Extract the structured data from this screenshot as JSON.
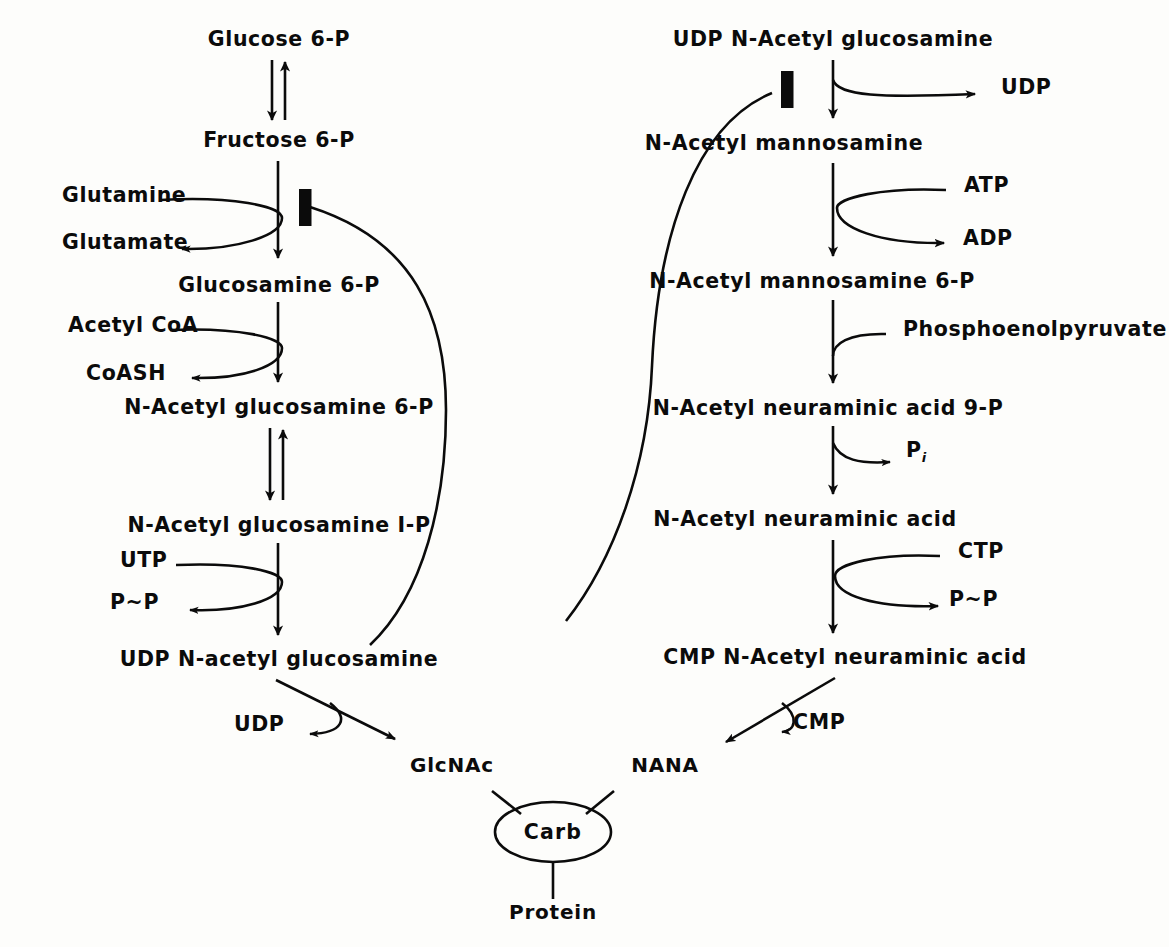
{
  "diagram": {
    "ink_color": "#0b0b0b",
    "background_color": "#fdfdfb"
  },
  "left_pathway": {
    "nodes": [
      {
        "id": "glucose-6-p",
        "label": "Glucose 6-P",
        "x": 279,
        "y": 37
      },
      {
        "id": "fructose-6-p",
        "label": "Fructose 6-P",
        "x": 279,
        "y": 138
      },
      {
        "id": "glucosamine-6-p",
        "label": "Glucosamine 6-P",
        "x": 279,
        "y": 283
      },
      {
        "id": "n-acetyl-glucosamine-6-p",
        "label": "N-Acetyl glucosamine 6-P",
        "x": 279,
        "y": 405
      },
      {
        "id": "n-acetyl-glucosamine-1-p",
        "label": "N-Acetyl glucosamine I-P",
        "x": 279,
        "y": 523
      },
      {
        "id": "udp-n-acetyl-glucosamine",
        "label": "UDP N-acetyl glucosamine",
        "x": 279,
        "y": 657
      }
    ],
    "cofactors": [
      {
        "id": "glutamine",
        "label": "Glutamine",
        "x": 62,
        "y": 193,
        "role": "substrate-in"
      },
      {
        "id": "glutamate",
        "label": "Glutamate",
        "x": 62,
        "y": 240,
        "role": "product-out"
      },
      {
        "id": "acetyl-coa",
        "label": "Acetyl CoA",
        "x": 68,
        "y": 323,
        "role": "substrate-in"
      },
      {
        "id": "coash",
        "label": "CoASH",
        "x": 86,
        "y": 371,
        "role": "product-out"
      },
      {
        "id": "utp",
        "label": "UTP",
        "x": 120,
        "y": 558,
        "role": "substrate-in"
      },
      {
        "id": "ppi",
        "label": "P~P",
        "x": 110,
        "y": 600,
        "role": "product-out"
      },
      {
        "id": "udp-out",
        "label": "UDP",
        "x": 234,
        "y": 722,
        "role": "product-out"
      }
    ]
  },
  "right_pathway": {
    "nodes": [
      {
        "id": "udp-n-acetyl-glucosamine-top",
        "label": "UDP N-Acetyl glucosamine",
        "x": 833,
        "y": 37
      },
      {
        "id": "n-acetyl-mannosamine",
        "label": "N-Acetyl mannosamine",
        "x": 784,
        "y": 141
      },
      {
        "id": "n-acetyl-mannosamine-6-p",
        "label": "N-Acetyl mannosamine 6-P",
        "x": 812,
        "y": 279
      },
      {
        "id": "n-acetyl-neuraminic-acid-9-p",
        "label": "N-Acetyl neuraminic acid 9-P",
        "x": 828,
        "y": 406
      },
      {
        "id": "n-acetyl-neuraminic-acid",
        "label": "N-Acetyl neuraminic acid",
        "x": 805,
        "y": 517
      },
      {
        "id": "cmp-n-acetyl-neuraminic-acid",
        "label": "CMP N-Acetyl neuraminic acid",
        "x": 845,
        "y": 655
      }
    ],
    "cofactors": [
      {
        "id": "udp",
        "label": "UDP",
        "x": 1001,
        "y": 85,
        "role": "product-out"
      },
      {
        "id": "atp",
        "label": "ATP",
        "x": 964,
        "y": 183,
        "role": "substrate-in"
      },
      {
        "id": "adp",
        "label": "ADP",
        "x": 963,
        "y": 236,
        "role": "product-out"
      },
      {
        "id": "phosphoenolpyruvate",
        "label": "Phosphoenolpyruvate",
        "x": 903,
        "y": 327,
        "role": "substrate-in"
      },
      {
        "id": "pi",
        "label": "P",
        "x": 906,
        "y": 448,
        "role": "product-out",
        "subscript": "i"
      },
      {
        "id": "ctp",
        "label": "CTP",
        "x": 958,
        "y": 549,
        "role": "substrate-in"
      },
      {
        "id": "ppi",
        "label": "P~P",
        "x": 949,
        "y": 597,
        "role": "product-out"
      },
      {
        "id": "cmp-out",
        "label": "CMP",
        "x": 793,
        "y": 720,
        "role": "product-out"
      }
    ]
  },
  "glycoprotein": {
    "center_node": {
      "id": "carb",
      "label": "Carb",
      "x": 553,
      "y": 830
    },
    "branches": [
      {
        "id": "glcnac",
        "label": "GlcNAc",
        "x": 452,
        "y": 763
      },
      {
        "id": "nana",
        "label": "NANA",
        "x": 665,
        "y": 763
      },
      {
        "id": "protein",
        "label": "Protein",
        "x": 553,
        "y": 910
      }
    ]
  },
  "feedback_inhibition": [
    {
      "id": "left-feedback-loop",
      "source": "UDP N-acetyl glucosamine",
      "target_step": "Fructose 6-P to Glucosamine 6-P",
      "marker": "inhibition-bar"
    },
    {
      "id": "right-feedback-loop",
      "source": "CMP N-Acetyl neuraminic acid",
      "target_step": "UDP N-Acetyl glucosamine to N-Acetyl mannosamine",
      "marker": "inhibition-bar"
    }
  ],
  "reversible_steps": [
    {
      "id": "g6p-f6p",
      "between": [
        "Glucose 6-P",
        "Fructose 6-P"
      ]
    },
    {
      "id": "glcnac6p-1p",
      "between": [
        "N-Acetyl glucosamine 6-P",
        "N-Acetyl glucosamine I-P"
      ]
    }
  ]
}
